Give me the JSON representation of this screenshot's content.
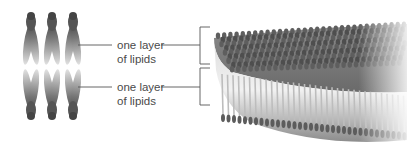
{
  "figure": {
    "labels": [
      {
        "line1": "one layer",
        "line2": "of lipids"
      },
      {
        "line1": "one layer",
        "line2": "of lipids"
      }
    ],
    "colors": {
      "line": "#555555",
      "lipid_head": "#5a5a5a",
      "lipid_tail": "#d4d4d4",
      "text": "#4a4a4a"
    },
    "lipid_columns": 3,
    "sheet_description": "3D sheet of lipid bilayer"
  }
}
